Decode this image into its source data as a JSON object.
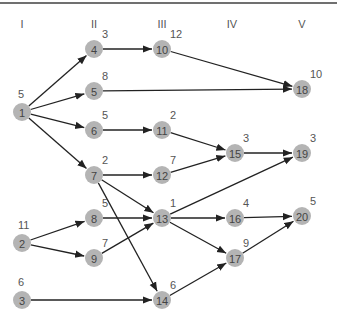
{
  "columns": [
    {
      "label": "I",
      "x": 22
    },
    {
      "label": "II",
      "x": 94
    },
    {
      "label": "III",
      "x": 162
    },
    {
      "label": "IV",
      "x": 232
    },
    {
      "label": "V",
      "x": 302
    }
  ],
  "nodes": [
    {
      "id": "1",
      "x": 22,
      "y": 112,
      "weight": "5"
    },
    {
      "id": "2",
      "x": 22,
      "y": 243,
      "weight": "11"
    },
    {
      "id": "3",
      "x": 22,
      "y": 300,
      "weight": "6"
    },
    {
      "id": "4",
      "x": 94,
      "y": 49,
      "weight": "3"
    },
    {
      "id": "5",
      "x": 94,
      "y": 91,
      "weight": "8"
    },
    {
      "id": "6",
      "x": 94,
      "y": 130,
      "weight": "5"
    },
    {
      "id": "7",
      "x": 94,
      "y": 175,
      "weight": "2"
    },
    {
      "id": "8",
      "x": 94,
      "y": 218,
      "weight": "5"
    },
    {
      "id": "9",
      "x": 94,
      "y": 258,
      "weight": "7"
    },
    {
      "id": "10",
      "x": 162,
      "y": 49,
      "weight": "12"
    },
    {
      "id": "11",
      "x": 162,
      "y": 130,
      "weight": "2"
    },
    {
      "id": "12",
      "x": 162,
      "y": 175,
      "weight": "7"
    },
    {
      "id": "13",
      "x": 162,
      "y": 218,
      "weight": "1"
    },
    {
      "id": "14",
      "x": 162,
      "y": 300,
      "weight": "6"
    },
    {
      "id": "15",
      "x": 235,
      "y": 153,
      "weight": "3"
    },
    {
      "id": "16",
      "x": 235,
      "y": 218,
      "weight": "4"
    },
    {
      "id": "17",
      "x": 235,
      "y": 258,
      "weight": "9"
    },
    {
      "id": "18",
      "x": 302,
      "y": 89,
      "weight": "10"
    },
    {
      "id": "19",
      "x": 302,
      "y": 153,
      "weight": "3"
    },
    {
      "id": "20",
      "x": 302,
      "y": 216,
      "weight": "5"
    }
  ],
  "edges": [
    [
      "1",
      "4"
    ],
    [
      "1",
      "5"
    ],
    [
      "1",
      "6"
    ],
    [
      "1",
      "7"
    ],
    [
      "2",
      "8"
    ],
    [
      "2",
      "9"
    ],
    [
      "3",
      "14"
    ],
    [
      "4",
      "10"
    ],
    [
      "5",
      "18"
    ],
    [
      "6",
      "11"
    ],
    [
      "7",
      "12"
    ],
    [
      "7",
      "13"
    ],
    [
      "7",
      "14"
    ],
    [
      "8",
      "13"
    ],
    [
      "9",
      "13"
    ],
    [
      "10",
      "18"
    ],
    [
      "11",
      "15"
    ],
    [
      "12",
      "15"
    ],
    [
      "13",
      "19"
    ],
    [
      "13",
      "16"
    ],
    [
      "13",
      "17"
    ],
    [
      "14",
      "17"
    ],
    [
      "15",
      "19"
    ],
    [
      "16",
      "20"
    ],
    [
      "17",
      "20"
    ]
  ],
  "colors": {
    "node_fill": "#b4b4b4",
    "edge": "#222222",
    "rule": "#707070"
  }
}
